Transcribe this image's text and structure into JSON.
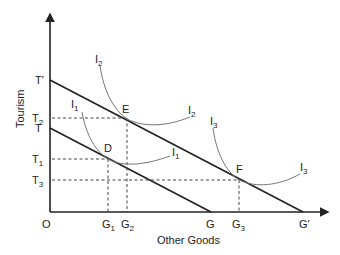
{
  "diagram": {
    "axes": {
      "x_label": "Other Goods",
      "y_label": "Tourism",
      "origin": "O"
    },
    "y_ticks": [
      {
        "id": "T_prime",
        "label": "T′"
      },
      {
        "id": "T2",
        "base": "T",
        "sub": "2"
      },
      {
        "id": "T",
        "label": "T"
      },
      {
        "id": "T1",
        "base": "T",
        "sub": "1"
      },
      {
        "id": "T3",
        "base": "T",
        "sub": "3"
      }
    ],
    "x_ticks": [
      {
        "id": "G1",
        "base": "G",
        "sub": "1"
      },
      {
        "id": "G2",
        "base": "G",
        "sub": "2"
      },
      {
        "id": "G",
        "label": "G"
      },
      {
        "id": "G3",
        "base": "G",
        "sub": "3"
      },
      {
        "id": "G_prime",
        "label": "G′"
      }
    ],
    "budget_lines": [
      {
        "name": "TG",
        "from": "T",
        "to": "G"
      },
      {
        "name": "T′G′",
        "from": "T′",
        "to": "G′"
      }
    ],
    "indifference_curves": [
      {
        "base": "I",
        "sub": "1",
        "tangent_point": "D"
      },
      {
        "base": "I",
        "sub": "2",
        "tangent_point": "E"
      },
      {
        "base": "I",
        "sub": "3",
        "tangent_point": "F"
      }
    ],
    "points": [
      {
        "label": "D",
        "x_tick": "G1",
        "y_tick": "T1"
      },
      {
        "label": "E",
        "x_tick": "G2",
        "y_tick": "T2"
      },
      {
        "label": "F",
        "x_tick": "G3",
        "y_tick": "T3"
      }
    ],
    "colors": {
      "axis": "#222222",
      "budget_line": "#222222",
      "curve": "#777777",
      "guide": "#444444"
    }
  }
}
